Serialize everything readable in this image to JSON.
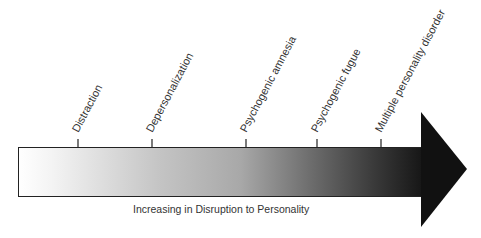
{
  "diagram": {
    "title": "",
    "caption": "Increasing in Disruption to Personality",
    "gradient": {
      "start": "#ffffff",
      "mid": "#b8b8b8",
      "end": "#1a1a1a"
    },
    "arrowhead_color": "#111111",
    "stages": [
      {
        "label": "Distraction",
        "x": 78
      },
      {
        "label": "Depersonalization",
        "x": 152
      },
      {
        "label": "Psychogenic amnesia",
        "x": 246
      },
      {
        "label": "Psychogenic fugue",
        "x": 317
      },
      {
        "label": "Multiple personality disorder",
        "x": 381
      }
    ]
  }
}
